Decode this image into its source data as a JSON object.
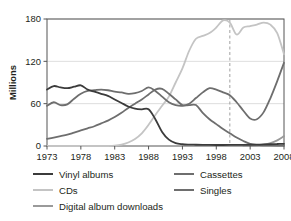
{
  "chart_data": {
    "type": "line",
    "title": "",
    "subtitle": "",
    "xlabel": "",
    "ylabel": "Millions",
    "xlim": [
      1973,
      2008
    ],
    "ylim": [
      0,
      180
    ],
    "yticks": [
      0,
      60,
      120,
      180
    ],
    "ytick_labels": [
      "0",
      "60",
      "120",
      "180"
    ],
    "xticks": [
      1973,
      1978,
      1983,
      1988,
      1993,
      1998,
      2003,
      2008
    ],
    "xtick_labels": [
      "1973",
      "1978",
      "1983",
      "1988",
      "1993",
      "1998",
      "2003",
      "2008"
    ],
    "grid": "horizontal",
    "legend_position": "below",
    "annotations": [
      {
        "name": "vertical-dashed-marker",
        "type": "vline",
        "x": 2000,
        "style": "dashed",
        "color": "#a0a0a0"
      }
    ],
    "x": [
      1973,
      1974,
      1975,
      1976,
      1977,
      1978,
      1979,
      1980,
      1981,
      1982,
      1983,
      1984,
      1985,
      1986,
      1987,
      1988,
      1989,
      1990,
      1991,
      1992,
      1993,
      1994,
      1995,
      1996,
      1997,
      1998,
      1999,
      2000,
      2001,
      2002,
      2003,
      2004,
      2005,
      2006,
      2007,
      2008
    ],
    "series": [
      {
        "name": "Vinyl albums",
        "color": "#3b3b3b",
        "width": 1.8,
        "values": [
          80,
          85,
          83,
          82,
          84,
          86,
          80,
          77,
          74,
          71,
          66,
          61,
          56,
          53,
          52,
          52,
          38,
          20,
          9,
          4,
          2.5,
          2,
          1.8,
          1.6,
          1.5,
          1.4,
          1.4,
          1.5,
          1.6,
          1.7,
          1.8,
          2,
          2.2,
          2.5,
          2.8,
          3
        ]
      },
      {
        "name": "Cassettes",
        "color": "#6e6e6e",
        "width": 1.8,
        "values": [
          10,
          12,
          14,
          16,
          19,
          22,
          25,
          28,
          32,
          36,
          41,
          47,
          54,
          60,
          66,
          73,
          80,
          81,
          74,
          66,
          58,
          58,
          58,
          47,
          38,
          31,
          24,
          18,
          12,
          7,
          3,
          1.5,
          1,
          0.8,
          0.7,
          0.6
        ]
      },
      {
        "name": "CDs",
        "color": "#c4c4c4",
        "width": 1.8,
        "values": [
          0,
          0,
          0,
          0,
          0,
          0,
          0,
          0,
          0,
          0,
          0.5,
          2,
          5,
          10,
          18,
          30,
          44,
          57,
          70,
          90,
          110,
          135,
          152,
          156,
          160,
          168,
          178,
          175,
          158,
          168,
          170,
          172,
          175,
          172,
          160,
          130
        ]
      },
      {
        "name": "Singles",
        "color": "#6e6e6e",
        "width": 1.8,
        "values": [
          57,
          62,
          58,
          59,
          67,
          74,
          78,
          79,
          80,
          79,
          77,
          76,
          74,
          75,
          78,
          83,
          78,
          70,
          62,
          58,
          57,
          60,
          68,
          76,
          82,
          80,
          76,
          72,
          62,
          50,
          39,
          38,
          48,
          68,
          92,
          118
        ]
      },
      {
        "name": "Digital album downloads",
        "color": "#9a9a9a",
        "width": 1.8,
        "values": [
          null,
          null,
          null,
          null,
          null,
          null,
          null,
          null,
          null,
          null,
          null,
          null,
          null,
          null,
          null,
          null,
          null,
          null,
          null,
          null,
          null,
          null,
          null,
          null,
          null,
          null,
          null,
          null,
          null,
          0,
          0.3,
          1,
          2,
          4,
          8,
          14
        ]
      }
    ]
  },
  "legend": {
    "columns": [
      {
        "name": "legend-column-left",
        "items": [
          {
            "label": "Vinyl albums",
            "color": "#3b3b3b"
          },
          {
            "label": "CDs",
            "color": "#c4c4c4"
          },
          {
            "label": "Digital album downloads",
            "color": "#9a9a9a"
          }
        ]
      },
      {
        "name": "legend-column-right",
        "items": [
          {
            "label": "Cassettes",
            "color": "#6e6e6e"
          },
          {
            "label": "Singles",
            "color": "#6e6e6e"
          }
        ]
      }
    ]
  }
}
